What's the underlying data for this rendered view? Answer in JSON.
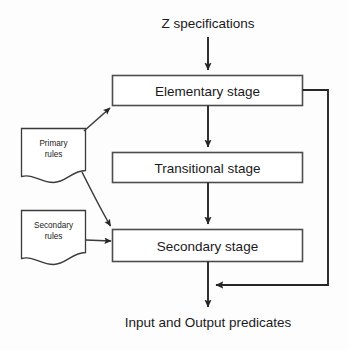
{
  "diagram": {
    "background_color": "#fdfdfd",
    "stroke_color": "#262626",
    "box_fill": "#ffffff",
    "top_input": {
      "label": "Z specifications"
    },
    "bottom_output": {
      "label": "Input and Output predicates"
    },
    "stages": [
      {
        "id": "elementary",
        "label": "Elementary stage"
      },
      {
        "id": "transitional",
        "label": "Transitional stage"
      },
      {
        "id": "secondary",
        "label": "Secondary stage"
      }
    ],
    "rule_docs": [
      {
        "id": "primary-rules",
        "line1": "Primary",
        "line2": "rules"
      },
      {
        "id": "secondary-rules",
        "line1": "Secondary",
        "line2": "rules"
      }
    ],
    "connections": [
      {
        "id": "input-to-elementary",
        "from": "Z specifications",
        "to": "Elementary stage",
        "kind": "arrow-down"
      },
      {
        "id": "elementary-to-transitional",
        "from": "Elementary stage",
        "to": "Transitional stage",
        "kind": "arrow-down"
      },
      {
        "id": "transitional-to-secondary",
        "from": "Transitional stage",
        "to": "Secondary stage",
        "kind": "arrow-down"
      },
      {
        "id": "secondary-to-output",
        "from": "Secondary stage",
        "to": "Input and Output predicates",
        "kind": "arrow-down"
      },
      {
        "id": "primary-to-elementary",
        "from": "Primary rules",
        "to": "Elementary stage",
        "kind": "arrow-diagonal-up"
      },
      {
        "id": "primary-to-secondary",
        "from": "Primary rules",
        "to": "Secondary stage",
        "kind": "arrow-curve-down"
      },
      {
        "id": "secondaryrules-to-secondary",
        "from": "Secondary rules",
        "to": "Secondary stage",
        "kind": "arrow-right"
      },
      {
        "id": "elementary-feedback",
        "from": "Elementary stage",
        "to": "Output junction",
        "kind": "feedback-loop-right"
      }
    ]
  }
}
